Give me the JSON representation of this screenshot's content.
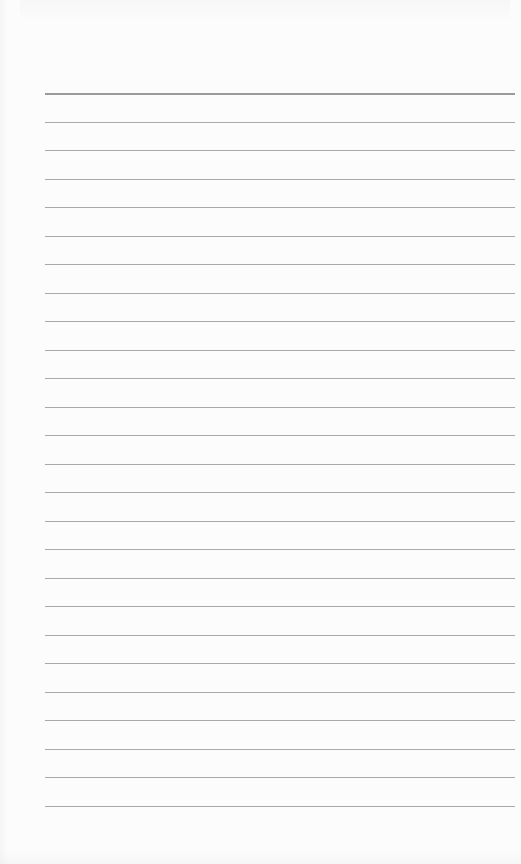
{
  "document": {
    "type": "ruled-paper",
    "text_content": "",
    "background_color": "#fcfcfc",
    "line_color": "#a9a9a9",
    "top_line_color": "#9a9a9a",
    "rules": {
      "count": 26,
      "first_y": 93,
      "spacing": 28.5,
      "left": 45,
      "right": 515
    }
  }
}
